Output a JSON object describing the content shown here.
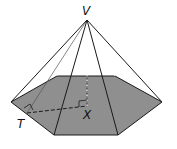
{
  "diagram": {
    "type": "hexagonal-pyramid",
    "labels": {
      "apex": "V",
      "base_center": "X",
      "edge_midpoint": "T"
    },
    "colors": {
      "base_fill": "#8f8f8f",
      "edge": "#1a1a1a",
      "background": "#ffffff"
    }
  }
}
